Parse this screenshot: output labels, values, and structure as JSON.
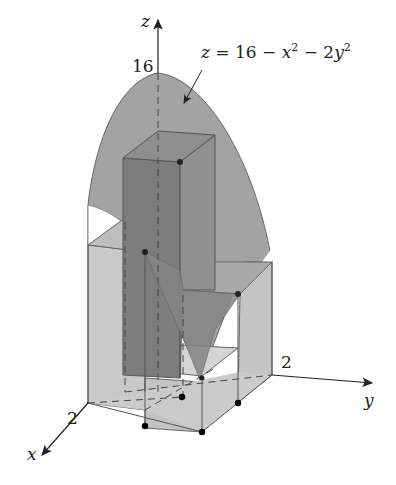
{
  "figure": {
    "surface_equation": "z = 16 − x² − 2y²",
    "surface_eq_parts": {
      "lhs": "z",
      "eq": " = 16 − ",
      "x": "x",
      "x_exp": "2",
      "mid": " − 2",
      "y": "y",
      "y_exp": "2"
    },
    "axes": {
      "z_label": "z",
      "x_label": "x",
      "y_label": "y",
      "z_tick": "16",
      "x_tick": "2",
      "y_tick": "2"
    },
    "colors": {
      "surface": "#9a9a9a",
      "box_light": "#c8c8c8",
      "box_dark": "#7a7a7a",
      "edge": "#555555",
      "axis": "#222222",
      "point": "#111111"
    }
  }
}
